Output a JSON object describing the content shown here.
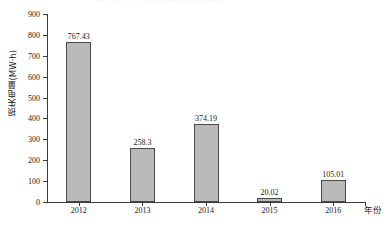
{
  "figure": {
    "top_ghost_text": "图1 2012—2016年某风电场弃风损失电量",
    "background_color": "#ffffff"
  },
  "chart_data": {
    "type": "bar",
    "title": "",
    "categories": [
      "2012",
      "2013",
      "2014",
      "2015",
      "2016"
    ],
    "values": [
      767.43,
      258.3,
      374.19,
      20.02,
      105.01
    ],
    "value_labels": [
      "767.43",
      "258.3",
      "374.19",
      "20.02",
      "105.01"
    ],
    "xlabel": "年份",
    "ylabel": "损失电量(MW·h)",
    "ylim": [
      0,
      900
    ],
    "ytick_step": 100,
    "yticks": [
      0,
      100,
      200,
      300,
      400,
      500,
      600,
      700,
      800,
      900
    ],
    "ytick_labels": [
      "0",
      "100",
      "200",
      "300",
      "400",
      "500",
      "600",
      "700",
      "800",
      "900"
    ],
    "grid": false,
    "legend": false,
    "legend_position": "none",
    "bar_fill_color": "#b9b9b9",
    "bar_border_color": "#4a4a4a",
    "axis_color": "#3a3a3a",
    "text_color": "#1a1a1a"
  }
}
